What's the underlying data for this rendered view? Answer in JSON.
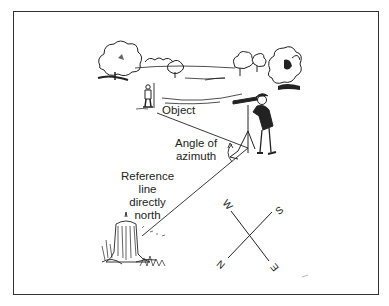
{
  "diagram": {
    "labels": {
      "object": "Object",
      "angle_line1": "Angle of",
      "angle_line2": "azimuth",
      "ref_line1": "Reference",
      "ref_line2": "line",
      "ref_line3": "directly",
      "ref_line4": "north"
    },
    "compass": {
      "north": "N",
      "south": "S",
      "east": "E",
      "west": "W"
    },
    "colors": {
      "ink": "#222222",
      "border": "#333333",
      "background": "#ffffff"
    }
  }
}
